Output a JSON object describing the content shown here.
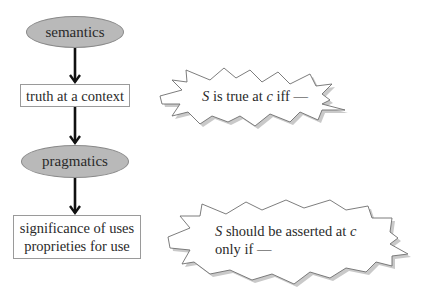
{
  "diagram": {
    "flow": {
      "nodes": [
        {
          "id": "semantics",
          "label": "semantics",
          "shape": "ellipse"
        },
        {
          "id": "truth",
          "label": "truth at a context",
          "shape": "box"
        },
        {
          "id": "pragmatics",
          "label": "pragmatics",
          "shape": "ellipse"
        },
        {
          "id": "significance",
          "line1": "significance of uses",
          "line2": "proprieties for use",
          "shape": "box"
        }
      ],
      "edges": [
        {
          "from": "semantics",
          "to": "truth"
        },
        {
          "from": "truth",
          "to": "pragmatics"
        },
        {
          "from": "pragmatics",
          "to": "significance"
        }
      ]
    },
    "callouts": [
      {
        "id": "truth-condition",
        "var_s": "S",
        "text_a": " is true at ",
        "var_c": "c",
        "text_b": " iff —"
      },
      {
        "id": "assertion-condition",
        "var_s": "S",
        "text_a": " should be asserted at ",
        "var_c": "c",
        "line2": "only if —"
      }
    ],
    "colors": {
      "ellipse_fill": "#b9b9b9",
      "arrow": "#111111",
      "burst_stroke": "#6e6e6e",
      "shadow": "#9c9c9c"
    }
  }
}
